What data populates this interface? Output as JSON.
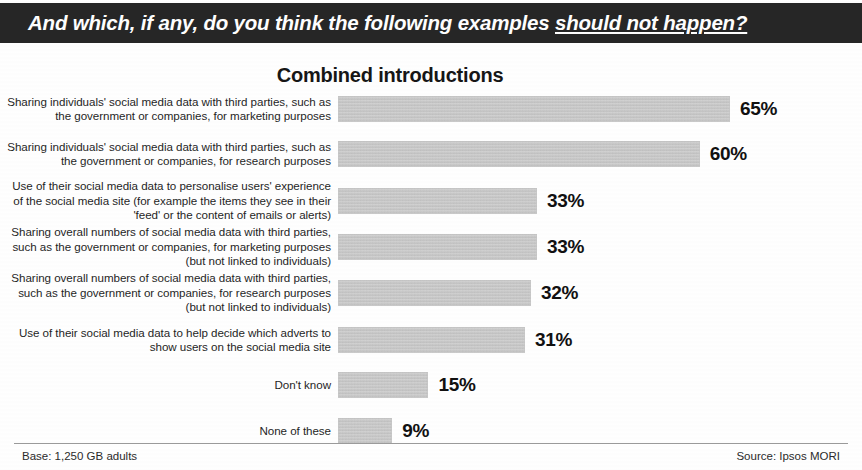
{
  "header": {
    "question_lead": "And which, if any, do you think the following examples ",
    "question_emphasis": "should not happen?"
  },
  "chart_data": {
    "type": "bar",
    "orientation": "horizontal",
    "title": "Combined introductions",
    "xlabel": "",
    "ylabel": "",
    "xlim": [
      0,
      65
    ],
    "grid": false,
    "legend": null,
    "value_suffix": "%",
    "categories": [
      "Sharing individuals' social media data with third parties, such as the government or companies, for marketing purposes",
      "Sharing individuals' social media data with third parties, such as the government or companies, for research purposes",
      "Use of their social media data to personalise users' experience of the social media site (for example the items they see in their 'feed' or the content of emails or alerts)",
      "Sharing overall numbers of social media data with third parties, such as the government or companies, for marketing purposes (but not linked to individuals)",
      "Sharing overall numbers of social media data with third parties, such as the government or companies, for research purposes (but not linked to individuals)",
      "Use of their social media data to help decide which adverts to show users on the social media site",
      "Don't know",
      "None of these"
    ],
    "values": [
      65,
      60,
      33,
      33,
      32,
      31,
      15,
      9
    ],
    "value_labels": [
      "65%",
      "60%",
      "33%",
      "33%",
      "32%",
      "31%",
      "15%",
      "9%"
    ],
    "bar_color": "#c6c6c6"
  },
  "footer": {
    "base": "Base: 1,250 GB adults",
    "source": "Source: Ipsos MORI"
  }
}
